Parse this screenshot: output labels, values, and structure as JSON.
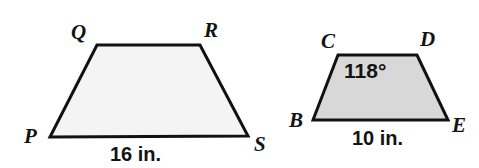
{
  "figure": {
    "background_color": "#ffffff",
    "stroke_color": "#111111",
    "shapes": [
      {
        "name": "trapezoid-PQRS",
        "label": "PQRS",
        "fill_color": "#f4f4f4",
        "vertices": [
          {
            "id": "P",
            "label": "P",
            "x": 50,
            "y": 137
          },
          {
            "id": "Q",
            "label": "Q",
            "x": 97,
            "y": 45
          },
          {
            "id": "R",
            "label": "R",
            "x": 200,
            "y": 45
          },
          {
            "id": "S",
            "label": "S",
            "x": 248,
            "y": 136
          }
        ],
        "side_measure": {
          "side": "PS",
          "text": "16 in.",
          "value": 16,
          "unit": "in."
        },
        "angle_measure": null
      },
      {
        "name": "trapezoid-BCDE",
        "label": "BCDE",
        "fill_color": "#d8d8d8",
        "vertices": [
          {
            "id": "B",
            "label": "B",
            "x": 313,
            "y": 120
          },
          {
            "id": "C",
            "label": "C",
            "x": 338,
            "y": 55
          },
          {
            "id": "D",
            "label": "D",
            "x": 417,
            "y": 55
          },
          {
            "id": "E",
            "label": "E",
            "x": 448,
            "y": 120
          }
        ],
        "side_measure": {
          "side": "BE",
          "text": "10 in.",
          "value": 10,
          "unit": "in."
        },
        "angle_measure": {
          "at_vertex": "C",
          "text": "118°",
          "value": 118,
          "unit": "degrees"
        }
      }
    ]
  },
  "labels": {
    "P": "P",
    "Q": "Q",
    "R": "R",
    "S": "S",
    "B": "B",
    "C": "C",
    "D": "D",
    "E": "E",
    "left_base_measure": "16 in.",
    "right_base_measure": "10 in.",
    "angle_at_C": "118°"
  }
}
